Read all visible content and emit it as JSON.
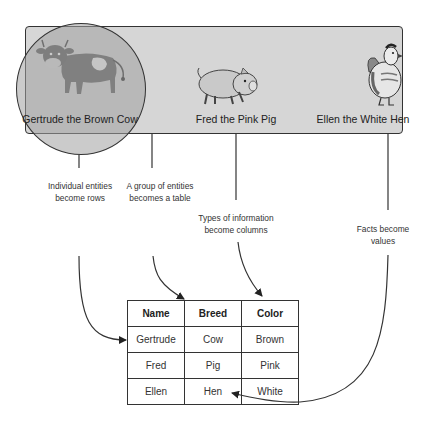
{
  "entities": [
    {
      "label": "Gertrude the Brown Cow",
      "icon": "cow-icon"
    },
    {
      "label": "Fred the Pink Pig",
      "icon": "pig-icon"
    },
    {
      "label": "Ellen the White Hen",
      "icon": "hen-icon"
    }
  ],
  "notes": {
    "rows": [
      "Individual entities",
      "become rows"
    ],
    "table": [
      "A group of entities",
      "becomes a table"
    ],
    "columns": [
      "Types of information",
      "become columns"
    ],
    "values": [
      "Facts become",
      "values"
    ]
  },
  "table": {
    "headers": [
      "Name",
      "Breed",
      "Color"
    ],
    "rows": [
      [
        "Gertrude",
        "Cow",
        "Brown"
      ],
      [
        "Fred",
        "Pig",
        "Pink"
      ],
      [
        "Ellen",
        "Hen",
        "White"
      ]
    ]
  },
  "colors": {
    "panel": "#d6d6d6",
    "highlight_circle": "#a0a0a0",
    "stroke": "#333333"
  }
}
